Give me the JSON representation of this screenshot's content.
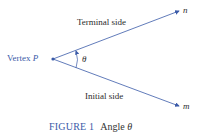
{
  "diagram": {
    "vertex_label": "Vertex",
    "vertex_point": "P",
    "terminal_label": "Terminal side",
    "initial_label": "Initial side",
    "ray_n": "n",
    "ray_m": "m",
    "angle_symbol": "θ",
    "line_color": "#3a5aa8"
  },
  "caption": {
    "figure": "FIGURE 1",
    "title": "Angle",
    "symbol": "θ"
  }
}
